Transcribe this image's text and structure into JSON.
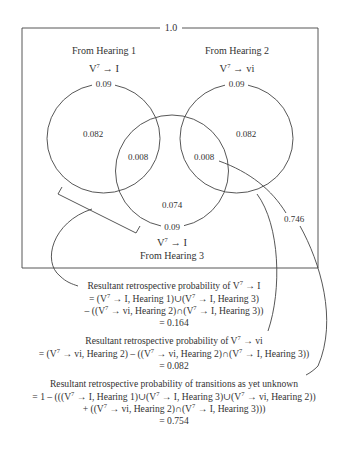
{
  "diagram": {
    "universe_label": "1.0",
    "sets": [
      {
        "title": "From Hearing 1",
        "transition_base": "V",
        "transition_sup": "7",
        "transition_target": "I",
        "total": "0.09",
        "exclusive": "0.082"
      },
      {
        "title": "From Hearing 2",
        "transition_base": "V",
        "transition_sup": "7",
        "transition_target": "vi",
        "total": "0.09",
        "exclusive": "0.082"
      },
      {
        "title": "From Hearing 3",
        "transition_base": "V",
        "transition_sup": "7",
        "transition_target": "I",
        "total": "0.09",
        "exclusive": "0.074"
      }
    ],
    "intersections": {
      "h1_h3": "0.008",
      "h2_h3": "0.008"
    },
    "outside_label": "0.746",
    "arrow": "→"
  },
  "equations": [
    {
      "heading_pre": "Resultant retrospective probability of V",
      "heading_sup": "7",
      "heading_post": "→ I",
      "lines": [
        [
          "= (V",
          "7",
          "→ I, Hearing 1)∪(V",
          "7",
          "→ I, Hearing 3)"
        ],
        [
          "– ((V",
          "7",
          "→ vi, Hearing 2)∩(V",
          "7",
          "→ I, Hearing 3))"
        ]
      ],
      "result": "= 0.164"
    },
    {
      "heading_pre": "Resultant retrospective probability of V",
      "heading_sup": "7",
      "heading_post": "→ vi",
      "lines": [
        [
          "= (V",
          "7",
          "→ vi, Hearing 2) – ((V",
          "7",
          "→ vi, Hearing 2)∩(V",
          "7",
          "→ I, Hearing 3))"
        ]
      ],
      "result": "= 0.082"
    },
    {
      "heading_pre": "Resultant retrospective probability of transitions as yet unknown",
      "lines": [
        [
          "= 1 – (((V",
          "7",
          "→ I, Hearing 1)∪(V",
          "7",
          "→ I, Hearing 3)∪(V",
          "7",
          "→ vi, Hearing 2))"
        ],
        [
          "+ ((V",
          "7",
          "→ vi, Hearing 2)∩(V",
          "7",
          "→ I, Hearing 3)))"
        ]
      ],
      "result": "= 0.754"
    }
  ]
}
